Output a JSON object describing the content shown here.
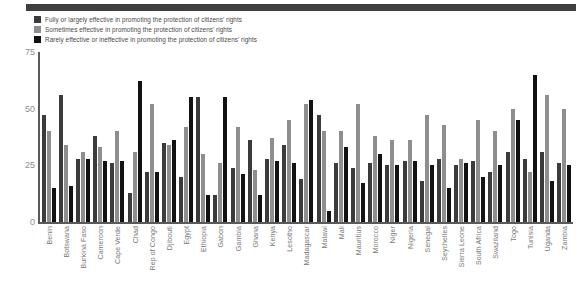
{
  "chart_data": {
    "type": "bar",
    "title": "",
    "subtitle": "",
    "xlabel": "",
    "ylabel": "",
    "ylim": [
      0,
      75
    ],
    "yticks": [
      0,
      25,
      50,
      75
    ],
    "ytick_labels": [
      "0",
      "25",
      "50",
      "75"
    ],
    "grid": false,
    "legend_position": "top-left",
    "orientation": "vertical",
    "categories": [
      "Benin",
      "Botswana",
      "Burkina Faso",
      "Cameroon",
      "Cape Verde",
      "Chad",
      "Rep of Congo",
      "Djibouti",
      "Egypt",
      "Ethiopia",
      "Gabon",
      "Gambia",
      "Ghana",
      "Kenya",
      "Lesotho",
      "Madagascar",
      "Malawi",
      "Mali",
      "Mauritius",
      "Morocco",
      "Niger",
      "Nigeria",
      "Senegal",
      "Seychelles",
      "Sierra Leone",
      "South Africa",
      "Swaziland",
      "Togo",
      "Tunisia",
      "Uganda",
      "Zambia"
    ],
    "series": [
      {
        "name": "Fully or largely effective in promoting the protection of citizens' rights",
        "color": "#3b3b3b",
        "values": [
          47,
          56,
          28,
          38,
          26,
          13,
          22,
          35,
          20,
          55,
          12,
          24,
          36,
          28,
          34,
          19,
          47,
          26,
          24,
          26,
          25,
          27,
          18,
          28,
          25,
          27,
          22,
          31,
          28,
          31,
          26
        ]
      },
      {
        "name": "Sometimes effective in promoting the protection of citizens' rights",
        "color": "#8e8e8e",
        "values": [
          40,
          34,
          31,
          33,
          40,
          31,
          52,
          34,
          42,
          30,
          26,
          42,
          23,
          37,
          45,
          52,
          40,
          40,
          52,
          38,
          36,
          36,
          47,
          43,
          28,
          45,
          40,
          50,
          22,
          56,
          50
        ]
      },
      {
        "name": "Rarely effective or ineffective in promoting the protection of citizens' rights",
        "color": "#121212",
        "values": [
          15,
          16,
          28,
          27,
          27,
          62,
          22,
          36,
          55,
          12,
          55,
          21,
          12,
          27,
          26,
          54,
          5,
          33,
          17,
          30,
          25,
          27,
          25,
          15,
          26,
          20,
          25,
          45,
          65,
          18,
          25
        ]
      }
    ]
  }
}
